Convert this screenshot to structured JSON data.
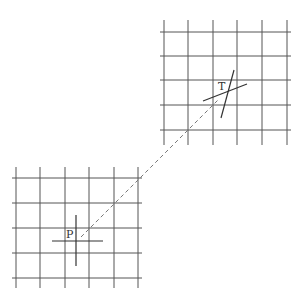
{
  "diagram": {
    "width": 301,
    "height": 299,
    "colors": {
      "grid": "#555555",
      "marker": "#333333",
      "dashed": "#777777",
      "background": "#ffffff"
    },
    "grids": [
      {
        "name": "target-grid",
        "verticals_x": [
          164,
          188,
          213,
          237,
          262,
          287
        ],
        "y_span": [
          20,
          145
        ],
        "horizontals_y": [
          32,
          56,
          80,
          105,
          130
        ],
        "x_span": [
          160,
          291
        ]
      },
      {
        "name": "origin-grid",
        "verticals_x": [
          16,
          40,
          65,
          89,
          114,
          138
        ],
        "y_span": [
          167,
          288
        ],
        "horizontals_y": [
          178,
          203,
          228,
          253,
          278
        ],
        "x_span": [
          12,
          142
        ]
      }
    ],
    "markers": {
      "P": {
        "label": "P",
        "label_pos": [
          66,
          238
        ],
        "lines": [
          [
            76,
            215,
            76,
            266
          ],
          [
            52,
            241,
            103,
            241
          ]
        ]
      },
      "T": {
        "label": "T",
        "label_pos": [
          218,
          90
        ],
        "lines": [
          [
            234,
            70,
            221,
            118
          ],
          [
            203,
            101,
            247,
            84
          ]
        ]
      }
    },
    "connector": {
      "from": [
        81,
        237
      ],
      "to": [
        219,
        99
      ],
      "style": "dashed"
    }
  }
}
